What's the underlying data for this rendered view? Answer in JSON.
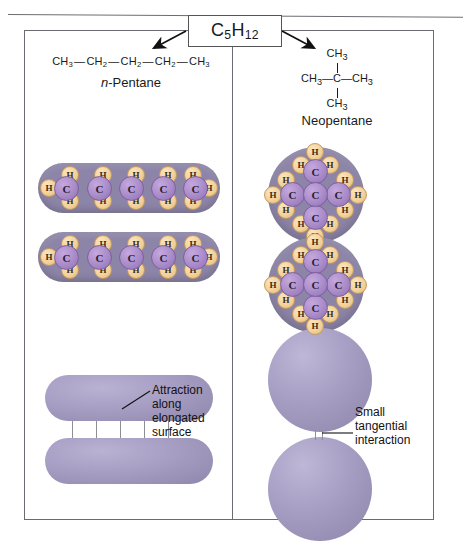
{
  "figure": {
    "title_formula": "C5H12",
    "title_formula_parts": {
      "c": "C",
      "c_sub": "5",
      "h": "H",
      "h_sub": "12"
    }
  },
  "left_panel": {
    "structural_formula": "CH3—CH2—CH2—CH2—CH3",
    "structure_units": [
      "CH3",
      "CH2",
      "CH2",
      "CH2",
      "CH3"
    ],
    "name_prefix": "n",
    "name_rest": "-Pentane",
    "name_full": "n-Pentane",
    "callout": "Attraction along elongated surface",
    "callout_lines": [
      "Attraction",
      "along",
      "elongated",
      "surface"
    ],
    "model": {
      "shape": "capsule",
      "carbon_label": "C",
      "hydrogen_label": "H",
      "carbon_count": 5,
      "hydrogen_count": 12,
      "top_hydrogens": [
        "H",
        "H",
        "H",
        "H",
        "H"
      ],
      "bottom_hydrogens": [
        "H",
        "H",
        "H",
        "H",
        "H"
      ],
      "end_hydrogens": [
        "H",
        "H"
      ],
      "carbons": [
        "C",
        "C",
        "C",
        "C",
        "C"
      ]
    },
    "contact_lines": 5
  },
  "right_panel": {
    "structure_top": "CH3",
    "structure_left": "CH3",
    "structure_center": "C",
    "structure_right": "CH3",
    "structure_bottom": "CH3",
    "name_full": "Neopentane",
    "callout": "Small tangential interaction",
    "callout_lines": [
      "Small",
      "tangential",
      "interaction"
    ],
    "model": {
      "shape": "sphere",
      "carbon_label": "C",
      "hydrogen_label": "H",
      "carbon_count": 5,
      "hydrogen_count": 12,
      "center_carbon": "C",
      "branch_carbons": [
        "C",
        "C",
        "C",
        "C"
      ]
    },
    "contact_lines": 2
  },
  "colors": {
    "carbon_atom": "#a98bc9",
    "hydrogen_atom": "#f2cf97",
    "molecule_body": "#8d85a8",
    "blob_purple": "#a79ec4",
    "border": "#6a6a70",
    "text": "#1a1a1a",
    "background": "#ffffff"
  }
}
